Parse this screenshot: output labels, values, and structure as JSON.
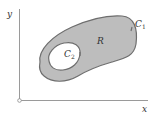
{
  "diagram": {
    "type": "region-with-hole",
    "axes": {
      "x_label": "x",
      "y_label": "y",
      "origin_marker": "open-circle"
    },
    "region": {
      "label": "R",
      "fill_color": "#bdbdbd",
      "outer_boundary": {
        "label": "C",
        "subscript": "1",
        "orientation": "counterclockwise"
      },
      "inner_boundary": {
        "label": "C",
        "subscript": "2",
        "orientation": "clockwise"
      }
    },
    "colors": {
      "axis": "#9a9a9a",
      "boundary": "#6e6e6e",
      "hole": "#ffffff",
      "text": "#333333"
    }
  }
}
